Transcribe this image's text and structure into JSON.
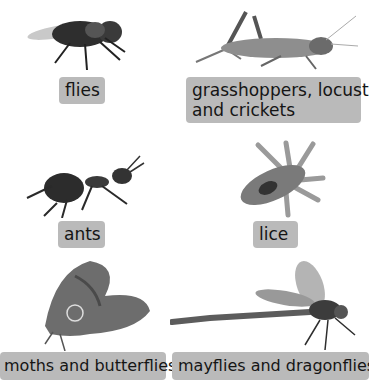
{
  "insects": [
    {
      "label": "flies",
      "icon": "fly-icon"
    },
    {
      "label_line1": "grasshoppers, locusts",
      "label_line2": "and crickets",
      "icon": "grasshopper-icon"
    },
    {
      "label": "ants",
      "icon": "ant-icon"
    },
    {
      "label": "lice",
      "icon": "louse-icon"
    },
    {
      "label": "moths and butterflies",
      "icon": "moth-icon"
    },
    {
      "label": "mayflies and dragonflies",
      "icon": "dragonfly-icon"
    }
  ],
  "colors": {
    "label_bg": "#bababa",
    "text": "#151515"
  }
}
